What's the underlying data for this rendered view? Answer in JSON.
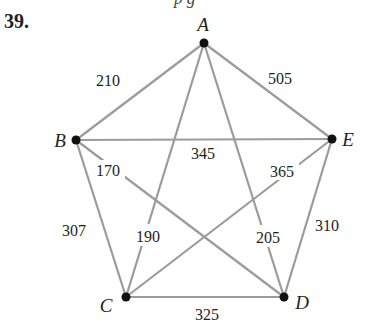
{
  "header": {
    "cutoff_text": "p g",
    "problem_number": "39."
  },
  "graph": {
    "type": "complete-weighted-graph",
    "nodes": [
      {
        "id": "A",
        "label": "A",
        "x": 204,
        "y": 43
      },
      {
        "id": "B",
        "label": "B",
        "x": 76,
        "y": 140
      },
      {
        "id": "C",
        "label": "C",
        "x": 126,
        "y": 297
      },
      {
        "id": "D",
        "label": "D",
        "x": 284,
        "y": 297
      },
      {
        "id": "E",
        "label": "E",
        "x": 332,
        "y": 139
      }
    ],
    "edges": [
      {
        "from": "A",
        "to": "B",
        "weight": "210"
      },
      {
        "from": "A",
        "to": "E",
        "weight": "505"
      },
      {
        "from": "B",
        "to": "E",
        "weight": "345"
      },
      {
        "from": "B",
        "to": "D",
        "weight": "170"
      },
      {
        "from": "E",
        "to": "C",
        "weight": "365"
      },
      {
        "from": "B",
        "to": "C",
        "weight": "307"
      },
      {
        "from": "A",
        "to": "C",
        "weight": "190"
      },
      {
        "from": "A",
        "to": "D",
        "weight": "205"
      },
      {
        "from": "E",
        "to": "D",
        "weight": "310"
      },
      {
        "from": "C",
        "to": "D",
        "weight": "325"
      }
    ],
    "colors": {
      "edge": "#9b9b9b",
      "node": "#111111",
      "text": "#231f20"
    }
  }
}
